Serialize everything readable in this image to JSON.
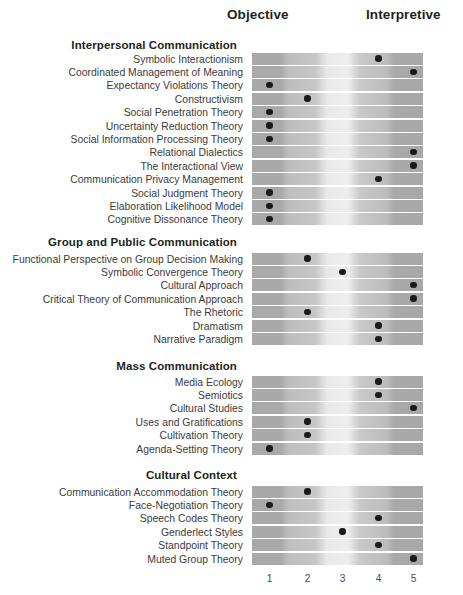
{
  "axis": {
    "left_label": "Objective",
    "right_label": "Interpretive",
    "scale_ticks": [
      "1",
      "2",
      "3",
      "4",
      "5"
    ]
  },
  "chart_data": {
    "type": "heatmap",
    "title": "",
    "xlabel": "",
    "ylabel": "",
    "axis_left": "Objective",
    "axis_right": "Interpretive",
    "scale_min": 1,
    "scale_max": 5,
    "categories": [
      "1",
      "2",
      "3",
      "4",
      "5"
    ],
    "grid": false,
    "legend_position": "none",
    "sections": [
      {
        "title": "Interpersonal Communication",
        "rows": [
          {
            "label": "Symbolic Interactionism",
            "value": 4
          },
          {
            "label": "Coordinated Management of Meaning",
            "value": 5
          },
          {
            "label": "Expectancy Violations Theory",
            "value": 1
          },
          {
            "label": "Constructivism",
            "value": 2
          },
          {
            "label": "Social Penetration Theory",
            "value": 1
          },
          {
            "label": "Uncertainty Reduction Theory",
            "value": 1
          },
          {
            "label": "Social Information Processing Theory",
            "value": 1
          },
          {
            "label": "Relational Dialectics",
            "value": 5
          },
          {
            "label": "The Interactional View",
            "value": 5
          },
          {
            "label": "Communication Privacy Management",
            "value": 4
          },
          {
            "label": "Social Judgment Theory",
            "value": 1
          },
          {
            "label": "Elaboration Likelihood Model",
            "value": 1
          },
          {
            "label": "Cognitive Dissonance Theory",
            "value": 1
          }
        ]
      },
      {
        "title": "Group and Public Communication",
        "rows": [
          {
            "label": "Functional Perspective on Group Decision Making",
            "value": 2
          },
          {
            "label": "Symbolic Convergence Theory",
            "value": 3
          },
          {
            "label": "Cultural Approach",
            "value": 5
          },
          {
            "label": "Critical Theory of Communication Approach",
            "value": 5
          },
          {
            "label": "The Rhetoric",
            "value": 2
          },
          {
            "label": "Dramatism",
            "value": 4
          },
          {
            "label": "Narrative Paradigm",
            "value": 4
          }
        ]
      },
      {
        "title": "Mass Communication",
        "rows": [
          {
            "label": "Media Ecology",
            "value": 4
          },
          {
            "label": "Semiotics",
            "value": 4
          },
          {
            "label": "Cultural Studies",
            "value": 5
          },
          {
            "label": "Uses and Gratifications",
            "value": 2
          },
          {
            "label": "Cultivation Theory",
            "value": 2
          },
          {
            "label": "Agenda-Setting Theory",
            "value": 1
          }
        ]
      },
      {
        "title": "Cultural Context",
        "rows": [
          {
            "label": "Communication Accommodation Theory",
            "value": 2
          },
          {
            "label": "Face-Negotiation Theory",
            "value": 1
          },
          {
            "label": "Speech Codes Theory",
            "value": 4
          },
          {
            "label": "Genderlect Styles",
            "value": 3
          },
          {
            "label": "Standpoint Theory",
            "value": 4
          },
          {
            "label": "Muted Group Theory",
            "value": 5
          }
        ]
      }
    ]
  },
  "colors": {
    "dot": "#1b1b1b",
    "band_dark": "#a9a9a9",
    "band_mid": "#c4c4c4",
    "band_light": "#ededed",
    "text": "#3b3b3b",
    "heading": "#231f20"
  }
}
